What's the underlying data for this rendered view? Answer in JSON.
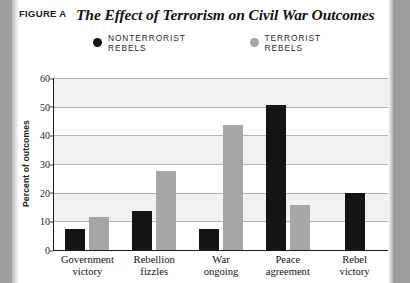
{
  "figure": {
    "label": "FIGURE A",
    "title": "The Effect of Terrorism on Civil War Outcomes"
  },
  "legend": [
    {
      "name": "nonterrorist-rebels",
      "label": "NONTERRORIST REBELS",
      "color": "#141414"
    },
    {
      "name": "terrorist-rebels",
      "label": "TERRORIST REBELS",
      "color": "#a6a6a6"
    }
  ],
  "chart_data": {
    "type": "bar",
    "title": "The Effect of Terrorism on Civil War Outcomes",
    "xlabel": "",
    "ylabel": "Percent of outcomes",
    "ylim": [
      0,
      60
    ],
    "yticks": [
      0,
      10,
      20,
      30,
      40,
      50,
      60
    ],
    "grid": true,
    "legend_position": "top",
    "categories": [
      "Government victory",
      "Rebellion fizzles",
      "War ongoing",
      "Peace agreement",
      "Rebel victory"
    ],
    "category_lines": [
      [
        "Government",
        "victory"
      ],
      [
        "Rebellion",
        "fizzles"
      ],
      [
        "War",
        "ongoing"
      ],
      [
        "Peace",
        "agreement"
      ],
      [
        "Rebel",
        "victory"
      ]
    ],
    "series": [
      {
        "name": "NONTERRORIST REBELS",
        "color": "#141414",
        "values": [
          7.5,
          13.5,
          7.3,
          50.5,
          20.0
        ]
      },
      {
        "name": "TERRORIST REBELS",
        "color": "#a6a6a6",
        "values": [
          11.5,
          27.5,
          43.5,
          15.8,
          null
        ]
      }
    ]
  }
}
